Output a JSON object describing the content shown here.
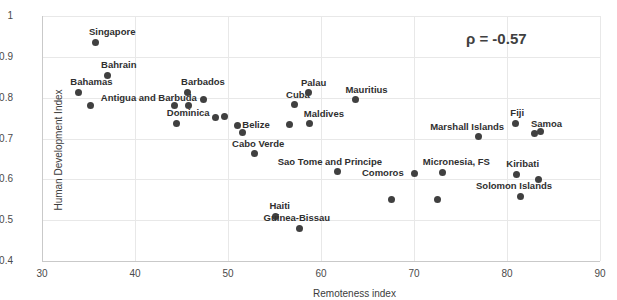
{
  "chart_data": {
    "type": "scatter",
    "title": "",
    "xlabel": "Remoteness index",
    "ylabel": "Human Development Index",
    "xlim": [
      30,
      90
    ],
    "ylim": [
      0.4,
      1.0
    ],
    "xticks": [
      "30",
      "40",
      "50",
      "60",
      "70",
      "80",
      "90"
    ],
    "yticks": [
      "1",
      "0.9",
      "0.8",
      "0.7",
      "0.6",
      "0.5",
      "0.4"
    ],
    "grid": true,
    "legend": "none",
    "annotations": [
      {
        "name": "correlation",
        "text": "ρ = -0.57"
      }
    ],
    "point_color": "#404040",
    "points": [
      {
        "label": "Singapore",
        "x": 35.7,
        "y": 0.936,
        "lx": -6,
        "ly": -15
      },
      {
        "label": "Bahrain",
        "x": 37.0,
        "y": 0.855,
        "lx": -6,
        "ly": -15
      },
      {
        "label": "Bahamas",
        "x": 33.9,
        "y": 0.813,
        "lx": -8,
        "ly": -15
      },
      {
        "label": "",
        "x": 35.2,
        "y": 0.781,
        "lx": 0,
        "ly": 0
      },
      {
        "label": "Barbados",
        "x": 45.6,
        "y": 0.813,
        "lx": -6,
        "ly": -15
      },
      {
        "label": "Antigua and Barbuda",
        "x": 47.4,
        "y": 0.796,
        "lx": -103,
        "ly": -6
      },
      {
        "label": "",
        "x": 44.2,
        "y": 0.781,
        "lx": 0,
        "ly": 0
      },
      {
        "label": "",
        "x": 45.8,
        "y": 0.781,
        "lx": 0,
        "ly": 0
      },
      {
        "label": "Dominica",
        "x": 44.5,
        "y": 0.737,
        "lx": -10,
        "ly": -15
      },
      {
        "label": "",
        "x": 48.7,
        "y": 0.752,
        "lx": 0,
        "ly": 0
      },
      {
        "label": "",
        "x": 49.6,
        "y": 0.754,
        "lx": 0,
        "ly": 0
      },
      {
        "label": "Belize",
        "x": 51.0,
        "y": 0.732,
        "lx": 5,
        "ly": -5
      },
      {
        "label": "",
        "x": 51.6,
        "y": 0.714,
        "lx": 0,
        "ly": 0
      },
      {
        "label": "Cabo Verde",
        "x": 52.8,
        "y": 0.663,
        "lx": -22,
        "ly": -15
      },
      {
        "label": "Cuba",
        "x": 57.1,
        "y": 0.783,
        "lx": -8,
        "ly": -15
      },
      {
        "label": "Palau",
        "x": 58.7,
        "y": 0.812,
        "lx": -8,
        "ly": -15
      },
      {
        "label": "Maldives",
        "x": 58.8,
        "y": 0.736,
        "lx": -6,
        "ly": -15
      },
      {
        "label": "",
        "x": 56.6,
        "y": 0.735,
        "lx": 0,
        "ly": 0
      },
      {
        "label": "Mauritius",
        "x": 63.7,
        "y": 0.795,
        "lx": -10,
        "ly": -15
      },
      {
        "label": "Sao Tome and Principe",
        "x": 61.8,
        "y": 0.618,
        "lx": -60,
        "ly": -15
      },
      {
        "label": "Haiti",
        "x": 55.1,
        "y": 0.509,
        "lx": -6,
        "ly": -15
      },
      {
        "label": "Guinea-Bissau",
        "x": 57.7,
        "y": 0.48,
        "lx": -36,
        "ly": -15
      },
      {
        "label": "Comoros",
        "x": 70.0,
        "y": 0.615,
        "lx": -52,
        "ly": -5
      },
      {
        "label": "",
        "x": 67.6,
        "y": 0.551,
        "lx": 0,
        "ly": 0
      },
      {
        "label": "Micronesia, FS",
        "x": 73.1,
        "y": 0.617,
        "lx": -20,
        "ly": -15
      },
      {
        "label": "",
        "x": 72.5,
        "y": 0.55,
        "lx": 0,
        "ly": 0
      },
      {
        "label": "Marshall Islands",
        "x": 76.9,
        "y": 0.704,
        "lx": -48,
        "ly": -15
      },
      {
        "label": "Fiji",
        "x": 80.9,
        "y": 0.737,
        "lx": -5,
        "ly": -15
      },
      {
        "label": "Kiribati",
        "x": 81.0,
        "y": 0.613,
        "lx": -10,
        "ly": -15
      },
      {
        "label": "Samoa",
        "x": 83.0,
        "y": 0.713,
        "lx": -4,
        "ly": -14
      },
      {
        "label": "",
        "x": 83.6,
        "y": 0.718,
        "lx": 0,
        "ly": 0
      },
      {
        "label": "",
        "x": 83.4,
        "y": 0.6,
        "lx": 0,
        "ly": 0
      },
      {
        "label": "Solomon Islands",
        "x": 81.4,
        "y": 0.558,
        "lx": -44,
        "ly": -15
      }
    ]
  }
}
